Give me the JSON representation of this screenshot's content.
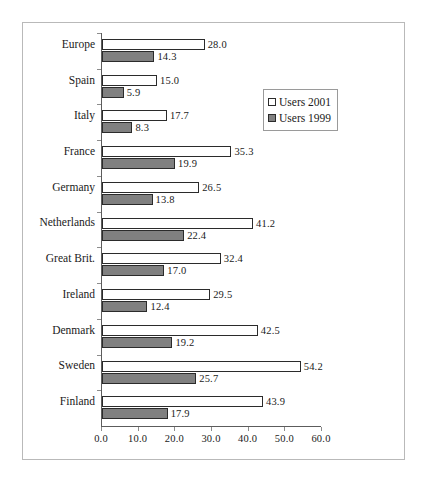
{
  "chart_data": {
    "type": "bar",
    "orientation": "horizontal",
    "title": "",
    "subtitle": "",
    "xlabel": "",
    "ylabel": "",
    "xlim": [
      0.0,
      60.0
    ],
    "xticks": [
      "0.0",
      "10.0",
      "20.0",
      "30.0",
      "40.0",
      "50.0",
      "60.0"
    ],
    "grid": false,
    "legend_position": "upper-right-inside",
    "categories": [
      "Europe",
      "Spain",
      "Italy",
      "France",
      "Germany",
      "Netherlands",
      "Great Brit.",
      "Ireland",
      "Denmark",
      "Sweden",
      "Finland"
    ],
    "series": [
      {
        "name": "Users 2001",
        "color": "#ffffff",
        "values": [
          28.0,
          15.0,
          17.7,
          35.3,
          26.5,
          41.2,
          32.4,
          29.5,
          42.5,
          54.2,
          43.9
        ],
        "labels": [
          "28.0",
          "15.0",
          "17.7",
          "35.3",
          "26.5",
          "41.2",
          "32.4",
          "29.5",
          "42.5",
          "54.2",
          "43.9"
        ]
      },
      {
        "name": "Users 1999",
        "color": "#808080",
        "values": [
          14.3,
          5.9,
          8.3,
          19.9,
          13.8,
          22.4,
          17.0,
          12.4,
          19.2,
          25.7,
          17.9
        ],
        "labels": [
          "14.3",
          "5.9",
          "8.3",
          "19.9",
          "13.8",
          "22.4",
          "17.0",
          "12.4",
          "19.2",
          "25.7",
          "17.9"
        ]
      }
    ]
  },
  "legend": {
    "items": [
      {
        "label": "Users 2001",
        "swatch": "white-square-icon"
      },
      {
        "label": "Users 1999",
        "swatch": "gray-square-icon"
      }
    ]
  }
}
